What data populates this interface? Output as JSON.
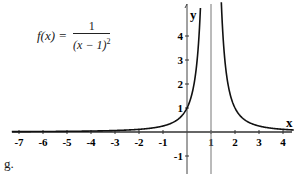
{
  "chart_data": {
    "type": "line",
    "function": "1/(x-1)^2",
    "xlabel": "x",
    "ylabel": "y",
    "xlim": [
      -7.5,
      4.5
    ],
    "ylim": [
      -1.8,
      5.3
    ],
    "x_ticks": [
      -7,
      -6,
      -5,
      -4,
      -3,
      -2,
      -1,
      1,
      2,
      3,
      4
    ],
    "y_ticks": [
      -1,
      1,
      2,
      3,
      4
    ],
    "vertical_asymptote": 1,
    "grid": false,
    "series": [
      {
        "name": "f(x)",
        "x": [
          -7,
          -6,
          -5,
          -4,
          -3,
          -2,
          -1,
          0,
          0.5,
          1.5,
          2,
          3,
          4
        ],
        "values": [
          0.016,
          0.02,
          0.028,
          0.04,
          0.0625,
          0.111,
          0.25,
          1,
          4,
          4,
          1,
          0.25,
          0.111
        ]
      }
    ]
  },
  "formula": {
    "lhs": "f(x) =",
    "numerator": "1",
    "denominator": "(x − 1)",
    "exponent": "2"
  },
  "axes": {
    "x_label": "x",
    "y_label": "y",
    "x_tick_labels": [
      "-7",
      "-6",
      "-5",
      "-4",
      "-3",
      "-2",
      "-1",
      "1",
      "2",
      "3",
      "4"
    ],
    "y_tick_labels": [
      "-1",
      "1",
      "2",
      "3",
      "4"
    ]
  },
  "sublabel": "g."
}
